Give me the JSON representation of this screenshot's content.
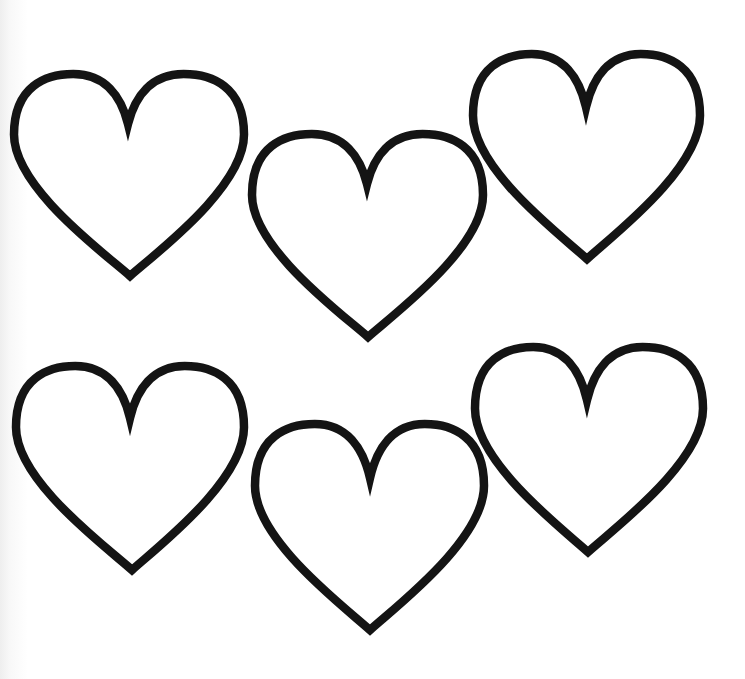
{
  "page": {
    "type": "coloring-page",
    "background_color": "#ffffff",
    "outline_color": "#141414",
    "fill_color": "#ffffff"
  },
  "hearts": [
    {
      "id": 1,
      "row": 1,
      "position": "top-left",
      "left": 10,
      "right": 248,
      "top": 70,
      "notch": [
        128,
        122
      ],
      "bottom": [
        130,
        282
      ]
    },
    {
      "id": 2,
      "row": 1,
      "position": "top-middle",
      "left": 248,
      "right": 487,
      "top": 130,
      "notch": [
        367,
        182
      ],
      "bottom": [
        368,
        343
      ]
    },
    {
      "id": 3,
      "row": 1,
      "position": "top-right",
      "left": 469,
      "right": 704,
      "top": 50,
      "notch": [
        586,
        105
      ],
      "bottom": [
        587,
        265
      ]
    },
    {
      "id": 4,
      "row": 2,
      "position": "bottom-left",
      "left": 12,
      "right": 248,
      "top": 362,
      "notch": [
        130,
        416
      ],
      "bottom": [
        132,
        576
      ]
    },
    {
      "id": 5,
      "row": 2,
      "position": "bottom-middle",
      "left": 251,
      "right": 488,
      "top": 420,
      "notch": [
        370,
        476
      ],
      "bottom": [
        370,
        636
      ]
    },
    {
      "id": 6,
      "row": 2,
      "position": "bottom-right",
      "left": 471,
      "right": 707,
      "top": 343,
      "notch": [
        587,
        398
      ],
      "bottom": [
        588,
        558
      ]
    }
  ]
}
